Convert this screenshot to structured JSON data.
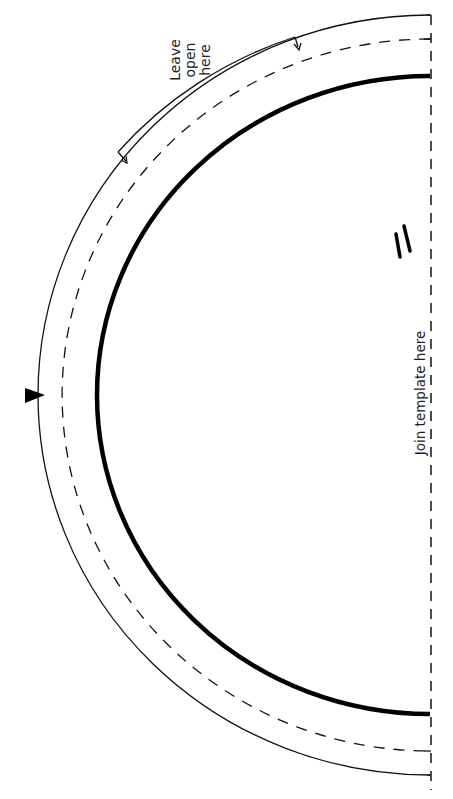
{
  "diagram": {
    "type": "sewing-pattern-template",
    "shape": "half-oval",
    "colors": {
      "line": "#111111",
      "background": "#ffffff",
      "text": "#222222"
    },
    "labels": {
      "leave_open_line1": "Leave",
      "leave_open_line2": "open",
      "leave_open_line3": "here",
      "join": "Join template here"
    },
    "lines": [
      {
        "name": "cutting-line",
        "style": "solid-thin"
      },
      {
        "name": "seam-allowance-line",
        "style": "dashed"
      },
      {
        "name": "finished-edge-line",
        "style": "solid-thick"
      },
      {
        "name": "join-line",
        "style": "dashed-vertical"
      }
    ],
    "markers": {
      "notch": "triangle-notch",
      "grainline": "double-slash"
    }
  }
}
